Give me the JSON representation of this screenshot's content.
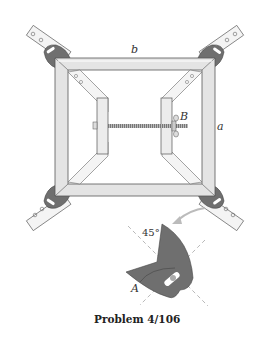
{
  "figure": {
    "caption": "Problem 4/106",
    "labels": {
      "top_side": "b",
      "right_side": "a",
      "wing_nut": "B",
      "detail_point": "A",
      "detail_angle": "45°"
    },
    "colors": {
      "frame_fill": "#e4e4e4",
      "frame_stroke": "#555555",
      "clamp_body": "#6f6f6f",
      "strap_fill": "#f4f4f4",
      "rod": "#444444",
      "dashed": "#8a8a8a"
    },
    "components": [
      "picture-frame",
      "corner-clamp-top-left",
      "corner-clamp-top-right",
      "corner-clamp-bottom-left",
      "corner-clamp-bottom-right",
      "left-plate",
      "right-plate",
      "threaded-rod",
      "wing-nut",
      "clamp-detail"
    ]
  }
}
